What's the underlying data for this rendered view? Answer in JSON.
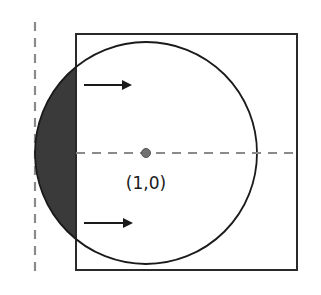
{
  "diagram": {
    "type": "geometry-figure",
    "center_label": "(1,0)",
    "colors": {
      "stroke": "#2a2a2a",
      "shade": "#3a3a3a",
      "dashed": "#8a8a8a",
      "center_dot": "#707070",
      "background": "#ffffff"
    },
    "square": {
      "x": 76,
      "y": 34,
      "width": 221,
      "height": 236
    },
    "circle": {
      "cx": 146,
      "cy": 153,
      "r": 111
    },
    "vertical_axis": {
      "x": 35,
      "y1": 22,
      "y2": 276
    },
    "horizontal_axis": {
      "y": 153,
      "x1": 76,
      "x2": 297
    },
    "arrows": [
      {
        "name": "top-arrow",
        "x1": 84,
        "x2": 130,
        "y": 85,
        "direction": "right"
      },
      {
        "name": "bottom-arrow",
        "x1": 84,
        "x2": 131,
        "y": 223,
        "direction": "right"
      }
    ],
    "shaded_region": "circular segment to the left of the square's left edge"
  }
}
